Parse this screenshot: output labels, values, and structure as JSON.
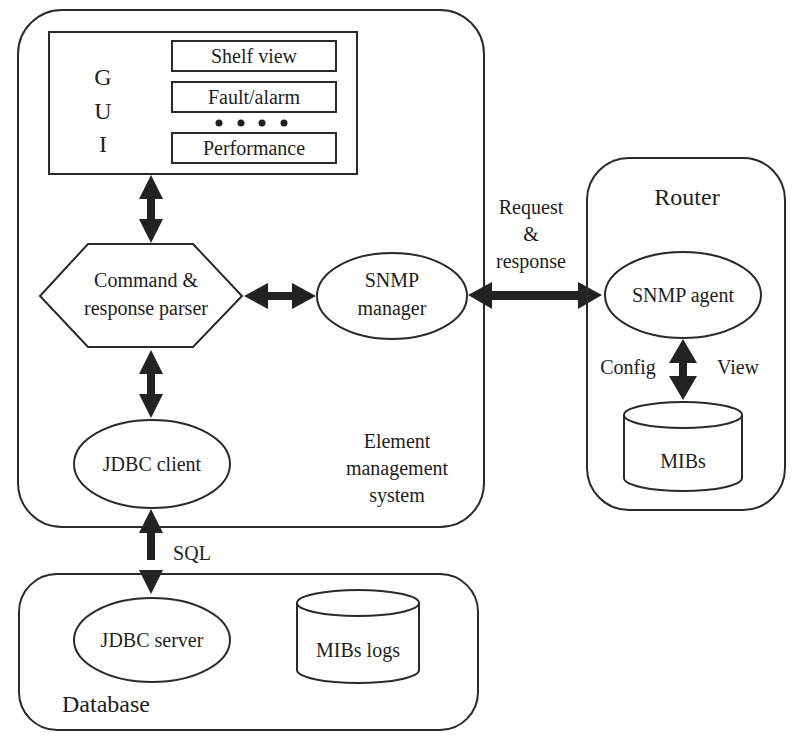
{
  "diagram": {
    "ems": {
      "label_line1": "Element",
      "label_line2": "management",
      "label_line3": "system"
    },
    "gui": {
      "letters": [
        "G",
        "U",
        "I"
      ],
      "items": [
        {
          "label": "Shelf view"
        },
        {
          "label": "Fault/alarm"
        },
        {
          "label": "Performance"
        }
      ],
      "ellipsis": "• • • •"
    },
    "parser": {
      "line1": "Command &",
      "line2": "response parser"
    },
    "snmp_manager": {
      "line1": "SNMP",
      "line2": "manager"
    },
    "jdbc_client": {
      "label": "JDBC client"
    },
    "link_request": {
      "line1": "Request",
      "line2": "&",
      "line3": "response"
    },
    "router": {
      "title": "Router",
      "snmp_agent": "SNMP agent",
      "config_label": "Config",
      "view_label": "View",
      "mibs": "MIBs"
    },
    "sql_label": "SQL",
    "database": {
      "title": "Database",
      "jdbc_server": "JDBC server",
      "mibs_logs": "MIBs logs"
    }
  }
}
